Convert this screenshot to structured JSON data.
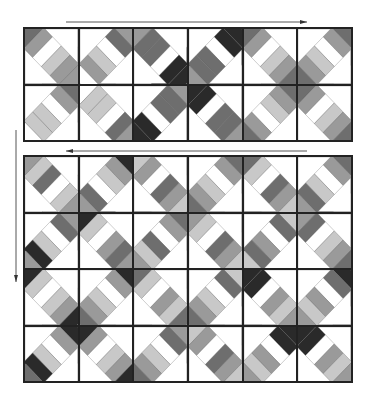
{
  "figure": {
    "caption": "",
    "colors": {
      "W": "#ffffff",
      "L": "#c8c8c8",
      "M": "#9a9a9a",
      "D": "#6e6e6e",
      "K": "#2a2a2a",
      "outline": "#222222"
    },
    "arrows": [
      {
        "name": "top-arrow-right",
        "x1": 66,
        "y1": 22,
        "x2": 307,
        "y2": 22,
        "direction": "right"
      },
      {
        "name": "middle-arrow-left",
        "x1": 307,
        "y1": 151,
        "x2": 66,
        "y2": 151,
        "direction": "left"
      },
      {
        "name": "left-arrow-down",
        "x1": 16,
        "y1": 130,
        "x2": 16,
        "y2": 282,
        "direction": "down"
      }
    ],
    "top_panel": {
      "rows": 2,
      "cols": 6,
      "blocks": [
        {
          "o": "A",
          "s": [
            "D",
            "M",
            "W",
            "L",
            "M",
            "M"
          ]
        },
        {
          "o": "B",
          "s": [
            "M",
            "D",
            "W",
            "L",
            "M",
            "W"
          ]
        },
        {
          "o": "A",
          "s": [
            "M",
            "D",
            "D",
            "W",
            "K",
            "K"
          ]
        },
        {
          "o": "B",
          "s": [
            "K",
            "K",
            "W",
            "D",
            "D",
            "M"
          ]
        },
        {
          "o": "A",
          "s": [
            "D",
            "M",
            "W",
            "L",
            "M",
            "D"
          ]
        },
        {
          "o": "B",
          "s": [
            "D",
            "M",
            "W",
            "L",
            "M",
            "D"
          ]
        },
        {
          "o": "B",
          "s": [
            "D",
            "M",
            "W",
            "L",
            "L",
            "W"
          ]
        },
        {
          "o": "A",
          "s": [
            "W",
            "L",
            "L",
            "W",
            "D",
            "M"
          ]
        },
        {
          "o": "B",
          "s": [
            "M",
            "D",
            "D",
            "W",
            "K",
            "K"
          ]
        },
        {
          "o": "A",
          "s": [
            "K",
            "K",
            "W",
            "D",
            "D",
            "M"
          ]
        },
        {
          "o": "B",
          "s": [
            "D",
            "M",
            "L",
            "W",
            "M",
            "D"
          ]
        },
        {
          "o": "A",
          "s": [
            "D",
            "M",
            "W",
            "L",
            "M",
            "D"
          ]
        }
      ]
    },
    "bottom_panel": {
      "rows": 4,
      "cols": 6,
      "blocks": [
        {
          "o": "A",
          "s": [
            "M",
            "L",
            "D",
            "W",
            "L",
            "M"
          ]
        },
        {
          "o": "B",
          "s": [
            "K",
            "M",
            "L",
            "W",
            "D",
            "M"
          ]
        },
        {
          "o": "A",
          "s": [
            "L",
            "M",
            "W",
            "D",
            "M",
            "L"
          ]
        },
        {
          "o": "B",
          "s": [
            "D",
            "M",
            "W",
            "L",
            "M",
            "D"
          ]
        },
        {
          "o": "A",
          "s": [
            "D",
            "L",
            "W",
            "D",
            "M",
            "L"
          ]
        },
        {
          "o": "B",
          "s": [
            "D",
            "M",
            "W",
            "L",
            "D",
            "M"
          ]
        },
        {
          "o": "B",
          "s": [
            "M",
            "D",
            "W",
            "L",
            "K",
            "M"
          ]
        },
        {
          "o": "A",
          "s": [
            "K",
            "L",
            "W",
            "M",
            "D",
            "M"
          ]
        },
        {
          "o": "B",
          "s": [
            "D",
            "M",
            "W",
            "D",
            "L",
            "M"
          ]
        },
        {
          "o": "A",
          "s": [
            "M",
            "L",
            "W",
            "D",
            "M",
            "L"
          ]
        },
        {
          "o": "B",
          "s": [
            "L",
            "D",
            "W",
            "M",
            "D",
            "L"
          ]
        },
        {
          "o": "A",
          "s": [
            "M",
            "D",
            "W",
            "L",
            "M",
            "D"
          ]
        },
        {
          "o": "A",
          "s": [
            "K",
            "L",
            "W",
            "L",
            "M",
            "K"
          ]
        },
        {
          "o": "B",
          "s": [
            "K",
            "M",
            "W",
            "L",
            "M",
            "D"
          ]
        },
        {
          "o": "A",
          "s": [
            "D",
            "L",
            "W",
            "M",
            "L",
            "D"
          ]
        },
        {
          "o": "B",
          "s": [
            "L",
            "D",
            "W",
            "L",
            "M",
            "D"
          ]
        },
        {
          "o": "A",
          "s": [
            "K",
            "K",
            "W",
            "M",
            "L",
            "M"
          ]
        },
        {
          "o": "B",
          "s": [
            "K",
            "D",
            "W",
            "M",
            "L",
            "M"
          ]
        },
        {
          "o": "B",
          "s": [
            "K",
            "M",
            "W",
            "L",
            "K",
            "D"
          ]
        },
        {
          "o": "A",
          "s": [
            "K",
            "M",
            "W",
            "L",
            "M",
            "K"
          ]
        },
        {
          "o": "B",
          "s": [
            "M",
            "D",
            "W",
            "L",
            "M",
            "D"
          ]
        },
        {
          "o": "A",
          "s": [
            "L",
            "M",
            "W",
            "D",
            "M",
            "L"
          ]
        },
        {
          "o": "B",
          "s": [
            "K",
            "K",
            "W",
            "M",
            "L",
            "M"
          ]
        },
        {
          "o": "A",
          "s": [
            "K",
            "K",
            "W",
            "M",
            "L",
            "M"
          ]
        }
      ]
    }
  }
}
